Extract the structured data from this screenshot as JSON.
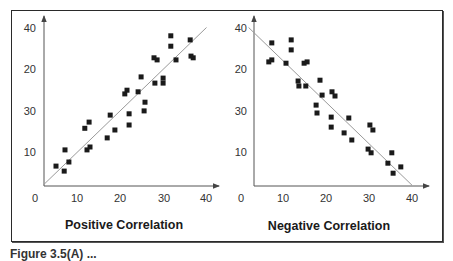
{
  "figure": {
    "frame_color": "#2a2a2a",
    "marker_color": "#1a1a1a",
    "line_color": "#9a9a9a",
    "axis_color": "#555555",
    "caption_partial": "Figure 3.5(A) ..."
  },
  "chart_data": [
    {
      "type": "scatter",
      "title": "Positive Correlation",
      "xlabel": "",
      "ylabel": "",
      "xlim": [
        0,
        40
      ],
      "ylim": [
        0,
        40
      ],
      "x_ticks": [
        "0",
        "10",
        "20",
        "30",
        "40"
      ],
      "y_ticks": [
        "10",
        "30",
        "20",
        "40"
      ],
      "grid": false,
      "trend_line": {
        "from": [
          2,
          2
        ],
        "to": [
          40,
          40
        ]
      },
      "points": [
        [
          5.0,
          6.6
        ],
        [
          6.9,
          5.4
        ],
        [
          7.1,
          10.5
        ],
        [
          8.0,
          7.6
        ],
        [
          11.7,
          15.7
        ],
        [
          12.7,
          17.2
        ],
        [
          12.2,
          10.5
        ],
        [
          12.9,
          11.2
        ],
        [
          16.9,
          13.4
        ],
        [
          17.6,
          18.9
        ],
        [
          18.7,
          15.3
        ],
        [
          21.0,
          24.0
        ],
        [
          21.5,
          24.9
        ],
        [
          22.0,
          19.2
        ],
        [
          22.0,
          16.5
        ],
        [
          24.1,
          24.5
        ],
        [
          24.8,
          28.1
        ],
        [
          25.7,
          22.0
        ],
        [
          25.5,
          19.9
        ],
        [
          27.8,
          32.7
        ],
        [
          28.5,
          32.2
        ],
        [
          28.0,
          26.6
        ],
        [
          29.9,
          27.8
        ],
        [
          29.9,
          26.6
        ],
        [
          31.7,
          38.0
        ],
        [
          31.7,
          35.5
        ],
        [
          32.9,
          32.2
        ],
        [
          36.2,
          37.0
        ],
        [
          36.4,
          33.1
        ],
        [
          36.9,
          32.7
        ]
      ]
    },
    {
      "type": "scatter",
      "title": "Negative Correlation",
      "xlabel": "",
      "ylabel": "",
      "xlim": [
        0,
        40
      ],
      "ylim": [
        0,
        40
      ],
      "x_ticks": [
        "0",
        "10",
        "20",
        "30",
        "40"
      ],
      "y_ticks": [
        "10",
        "30",
        "20",
        "40"
      ],
      "grid": false,
      "trend_line": {
        "from": [
          2,
          40
        ],
        "to": [
          40,
          2
        ]
      },
      "points": [
        [
          7.4,
          36.3
        ],
        [
          11.9,
          37.0
        ],
        [
          11.9,
          34.6
        ],
        [
          6.7,
          31.7
        ],
        [
          7.4,
          32.2
        ],
        [
          10.7,
          31.4
        ],
        [
          14.9,
          31.4
        ],
        [
          15.6,
          31.7
        ],
        [
          13.5,
          27.1
        ],
        [
          13.7,
          25.9
        ],
        [
          15.3,
          25.9
        ],
        [
          18.6,
          27.3
        ],
        [
          19.1,
          23.7
        ],
        [
          21.4,
          24.5
        ],
        [
          22.1,
          23.5
        ],
        [
          17.7,
          21.3
        ],
        [
          17.9,
          19.4
        ],
        [
          21.2,
          18.4
        ],
        [
          21.2,
          16.0
        ],
        [
          25.3,
          18.2
        ],
        [
          24.2,
          14.6
        ],
        [
          26.0,
          12.9
        ],
        [
          30.2,
          16.5
        ],
        [
          30.9,
          15.3
        ],
        [
          29.8,
          10.7
        ],
        [
          30.5,
          9.8
        ],
        [
          35.3,
          9.8
        ],
        [
          34.4,
          7.3
        ],
        [
          37.4,
          6.4
        ],
        [
          35.6,
          4.9
        ]
      ]
    }
  ]
}
